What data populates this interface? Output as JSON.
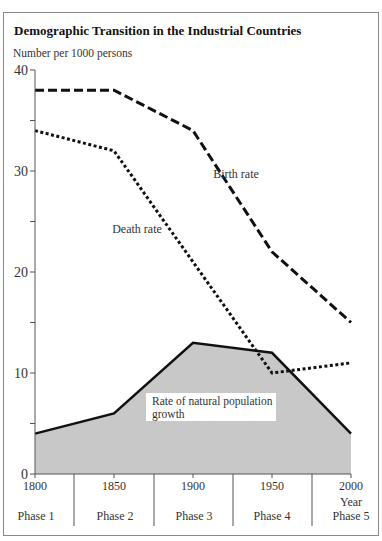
{
  "chart_data": {
    "type": "line",
    "title": "Demographic Transition in the Industrial Countries",
    "ylabel": "Number per 1000 persons",
    "xlabel": "Year",
    "x": [
      1800,
      1850,
      1900,
      1950,
      2000
    ],
    "ylim": [
      0,
      40
    ],
    "yticks": [
      0,
      10,
      20,
      30,
      40
    ],
    "series": [
      {
        "name": "Birth rate",
        "style": "long-dash",
        "values": [
          38,
          38,
          34,
          22,
          15
        ]
      },
      {
        "name": "Death rate",
        "style": "short-dash",
        "values": [
          34,
          32,
          21,
          10,
          11
        ]
      },
      {
        "name": "Rate of natural population growth",
        "style": "solid-filled-area",
        "fill": "#c8c8c8",
        "values": [
          4,
          6,
          13,
          12,
          4
        ]
      }
    ],
    "phases": [
      "Phase 1",
      "Phase 2",
      "Phase 3",
      "Phase 4",
      "Phase 5"
    ],
    "annotations": [
      "Birth rate",
      "Death rate",
      "Rate of natural population growth"
    ],
    "grid": false,
    "legend": "inline labels"
  },
  "labels": {
    "title": "Demographic Transition in the Industrial Countries",
    "ylabel": "Number per 1000 persons",
    "xlabel": "Year",
    "birth": "Birth rate",
    "death": "Death rate",
    "growth_line1": "Rate of natural population",
    "growth_line2": "growth",
    "yticks": [
      "0",
      "10",
      "20",
      "30",
      "40"
    ],
    "xticks": [
      "1800",
      "1850",
      "1900",
      "1950",
      "2000"
    ],
    "phases": [
      "Phase 1",
      "Phase 2",
      "Phase 3",
      "Phase 4",
      "Phase 5"
    ]
  },
  "colors": {
    "line": "#111111",
    "area": "#c8c8c8",
    "axis": "#555555"
  }
}
